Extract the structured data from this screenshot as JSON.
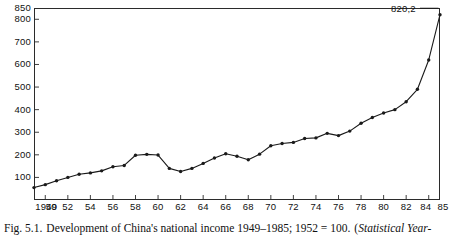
{
  "caption": {
    "prefix": "Fig. 5.1.",
    "text": "Development of China's national income 1949–1985; 1952 = 100.",
    "source_open": "(",
    "source_italic": "Statistical Year-"
  },
  "annotation": {
    "label": "820,2"
  },
  "chart_data": {
    "type": "line",
    "title": "Development of China's national income 1949–1985; 1952 = 100.",
    "xlabel": "",
    "ylabel": "",
    "ylim": [
      0,
      850
    ],
    "xlim": [
      1949,
      1985
    ],
    "grid": false,
    "legend": null,
    "markers": "filled-circle",
    "line_color": "#1a1a1a",
    "ytick_values": [
      100,
      200,
      300,
      400,
      500,
      600,
      700,
      800,
      850
    ],
    "ytick_labels": [
      "100",
      "200",
      "300",
      "400",
      "500",
      "600",
      "700",
      "800",
      "850"
    ],
    "xtick_values": [
      1949,
      1950,
      1952,
      1954,
      1956,
      1958,
      1960,
      1962,
      1964,
      1966,
      1968,
      1970,
      1972,
      1974,
      1976,
      1978,
      1980,
      1982,
      1984,
      1985
    ],
    "xtick_labels": [
      "1949",
      "50",
      "52",
      "54",
      "56",
      "58",
      "60",
      "62",
      "64",
      "66",
      "68",
      "70",
      "72",
      "74",
      "76",
      "78",
      "80",
      "82",
      "84",
      "85"
    ],
    "x": [
      1949,
      1950,
      1951,
      1952,
      1953,
      1954,
      1955,
      1956,
      1957,
      1958,
      1959,
      1960,
      1961,
      1962,
      1963,
      1964,
      1965,
      1966,
      1967,
      1968,
      1969,
      1970,
      1971,
      1972,
      1973,
      1974,
      1975,
      1976,
      1977,
      1978,
      1979,
      1980,
      1981,
      1982,
      1983,
      1984,
      1985
    ],
    "values": [
      55,
      68,
      85,
      100,
      114,
      120,
      129,
      147,
      153,
      198,
      202,
      199,
      140,
      126,
      140,
      162,
      186,
      205,
      194,
      178,
      203,
      240,
      250,
      255,
      272,
      275,
      295,
      285,
      305,
      340,
      365,
      385,
      400,
      435,
      490,
      620,
      820.2
    ],
    "annotations": [
      {
        "x": 1985,
        "y": 820.2,
        "text": "820,2"
      }
    ],
    "note": "Index, 1952 = 100"
  }
}
